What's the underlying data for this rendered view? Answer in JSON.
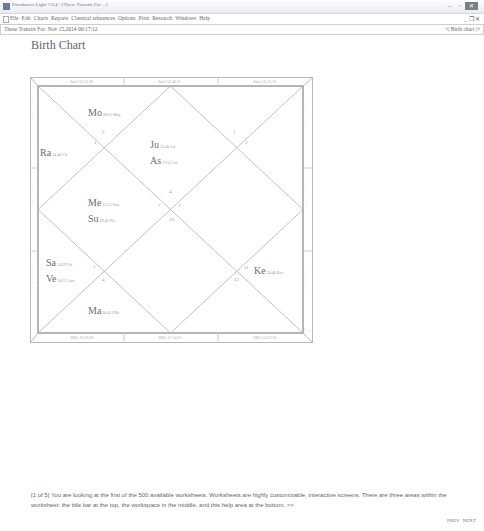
{
  "window": {
    "title": "Parashara's Light 7.0.4 - [These Transits For ...]",
    "controls": {
      "minimize": "–",
      "restore": "▫",
      "close": "✕"
    }
  },
  "menubar": {
    "items": [
      "File",
      "Edit",
      "Charts",
      "Reports",
      "Classical references",
      "Options",
      "Print",
      "Research",
      "Windows",
      "Help"
    ],
    "right_controls": "_ ❐ ✕"
  },
  "tabbar": {
    "left": "These Transits For: Nov 15,2014 00:17:12",
    "right": "<| Birth chart |>"
  },
  "page_title": "Birth Chart",
  "chart": {
    "type": "north-indian-diamond",
    "top_border_labels": [
      "SatA 10 52:38",
      "SatA 10 48:31",
      "SatA 10 53:18"
    ],
    "bottom_border_labels": [
      "SMA 10 18:58",
      "SMA 12 14:33",
      "SMA 10 07:35"
    ],
    "left_strip_labels": [
      "...  ..  ....",
      ".. ... .. ...",
      "... ... .. ..."
    ],
    "right_strip_labels": [
      ".. ... .. ....",
      ".. ... .. ....",
      ".. .. ... ...."
    ],
    "planets": [
      {
        "abbr": "Mo",
        "deg": "09:51 Mag",
        "house": 2
      },
      {
        "abbr": "Ra",
        "deg": "24:40 Cit",
        "house": 1
      },
      {
        "abbr": "Ju",
        "deg": "25:46 Asl",
        "house": 12
      },
      {
        "abbr": "As",
        "deg": "27:53 Asl",
        "house": 12
      },
      {
        "abbr": "Me",
        "deg": "12:33 Swa",
        "house": 3
      },
      {
        "abbr": "Su",
        "deg": "28:45 Vis",
        "house": 3
      },
      {
        "abbr": "Sa",
        "deg": "14:29 Vis",
        "house": 5
      },
      {
        "abbr": "Ve",
        "deg": "10:57 Anu",
        "house": 5
      },
      {
        "abbr": "Ma",
        "deg": "20:41 PSh",
        "house": 6
      },
      {
        "abbr": "Ke",
        "deg": "24:40 Rev",
        "house": 9
      }
    ],
    "house_numbers": [
      "2",
      "1",
      "1",
      "2",
      "4",
      "7",
      "1",
      "10",
      "5",
      "4",
      "11",
      "12"
    ]
  },
  "help": {
    "text": "[1 of 5] You are looking at the first of the 500 available worksheets. Worksheets are highly customizable, interactive screens. There are three areas within the worksheet: the title bar at the top, the workspace in the middle, and this help area at the bottom.",
    "more_link": ">>"
  },
  "footer": {
    "prev": "PREV",
    "next": "NEXT"
  }
}
